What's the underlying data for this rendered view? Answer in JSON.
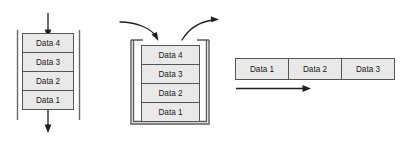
{
  "figure": {
    "name": "data-structure-diagram",
    "background_color": "#ffffff",
    "cell_fill_color": "#e9e9e9",
    "cell_border_color": "#555555",
    "arrow_color": "#1f1f1f",
    "rail_color": "#6a6a6a",
    "text_color": "#1a1a1a"
  },
  "queue": {
    "name": "queue-diagram",
    "cells": [
      {
        "label": "Data 4"
      },
      {
        "label": "Data 3"
      },
      {
        "label": "Data 2"
      },
      {
        "label": "Data 1"
      }
    ],
    "input_arrow": {
      "name": "queue-input-arrow",
      "direction": "down"
    },
    "output_arrow": {
      "name": "queue-output-arrow",
      "direction": "down"
    },
    "left_rail": {
      "name": "queue-left-rail"
    },
    "right_rail": {
      "name": "queue-right-rail"
    }
  },
  "stack": {
    "name": "stack-diagram",
    "cells": [
      {
        "label": "Data 4"
      },
      {
        "label": "Data 3"
      },
      {
        "label": "Data 2"
      },
      {
        "label": "Data 1"
      }
    ],
    "push_arrow": {
      "name": "stack-push-arrow",
      "direction": "curve-down-right"
    },
    "pop_arrow": {
      "name": "stack-pop-arrow",
      "direction": "curve-up-right"
    },
    "container": {
      "name": "stack-container-outline",
      "shape": "u-shape"
    }
  },
  "array": {
    "name": "array-diagram",
    "cells": [
      {
        "label": "Data 1"
      },
      {
        "label": "Data 2"
      },
      {
        "label": "Data 3"
      }
    ],
    "traverse_arrow": {
      "name": "array-traverse-arrow",
      "direction": "right"
    }
  }
}
